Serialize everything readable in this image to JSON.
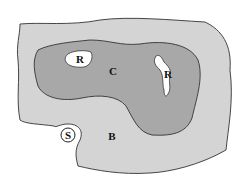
{
  "diagram": {
    "regions": [
      {
        "id": "B",
        "label": "B",
        "name": "outer-region",
        "fill": "#d4d4d4"
      },
      {
        "id": "C",
        "label": "C",
        "name": "central-region",
        "fill": "#a8a8a8"
      },
      {
        "id": "R1",
        "label": "R",
        "name": "inner-hole-left",
        "fill": "#ffffff"
      },
      {
        "id": "R2",
        "label": "R",
        "name": "inner-hole-right",
        "fill": "#ffffff"
      },
      {
        "id": "S",
        "label": "S",
        "name": "source-circle",
        "fill": "#ffffff"
      }
    ],
    "colors": {
      "outline": "#333333",
      "outer": "#d4d4d4",
      "central": "#a8a8a8",
      "hole": "#ffffff"
    }
  }
}
